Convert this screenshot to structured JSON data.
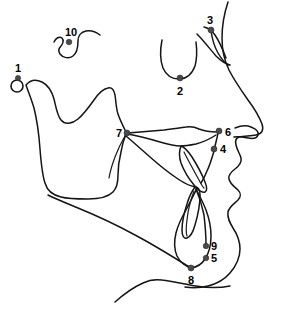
{
  "figure": {
    "type": "lateral-skull-tracing",
    "background_color": "#ffffff",
    "line_color": "#151515",
    "dot_color": "#4a4a4a",
    "label_color": "#000000",
    "width": 282,
    "height": 309
  },
  "landmarks": [
    {
      "id": "1",
      "label": "1",
      "dot_x": 18,
      "dot_y": 78,
      "label_x": 18,
      "label_y": 70,
      "marker": "ring",
      "ring_cx": 17,
      "ring_cy": 86,
      "ring_r": 6
    },
    {
      "id": "2",
      "label": "2",
      "dot_x": 180,
      "dot_y": 78,
      "label_x": 180,
      "label_y": 94,
      "marker": "dot"
    },
    {
      "id": "3",
      "label": "3",
      "dot_x": 211,
      "dot_y": 30,
      "label_x": 210,
      "label_y": 22,
      "marker": "dot"
    },
    {
      "id": "4",
      "label": "4",
      "dot_x": 214,
      "dot_y": 149,
      "label_x": 222,
      "label_y": 153,
      "marker": "dot"
    },
    {
      "id": "5",
      "label": "5",
      "dot_x": 206,
      "dot_y": 258,
      "label_x": 213,
      "label_y": 262,
      "marker": "dot"
    },
    {
      "id": "6",
      "label": "6",
      "dot_x": 219,
      "dot_y": 131,
      "label_x": 226,
      "label_y": 135,
      "marker": "dot"
    },
    {
      "id": "7",
      "label": "7",
      "dot_x": 127,
      "dot_y": 133,
      "label_x": 119,
      "label_y": 137,
      "marker": "dot"
    },
    {
      "id": "8",
      "label": "8",
      "dot_x": 191,
      "dot_y": 268,
      "label_x": 191,
      "label_y": 283,
      "marker": "dot"
    },
    {
      "id": "9",
      "label": "9",
      "dot_x": 206,
      "dot_y": 246,
      "label_x": 213,
      "label_y": 250,
      "marker": "dot"
    },
    {
      "id": "10",
      "label": "10",
      "dot_x": 69,
      "dot_y": 42,
      "label_x": 71,
      "label_y": 36,
      "marker": "dot"
    }
  ],
  "structures": [
    {
      "name": "soft-tissue-profile"
    },
    {
      "name": "nasal-bone"
    },
    {
      "name": "orbit-floor"
    },
    {
      "name": "sella-turcica"
    },
    {
      "name": "mandible-outline"
    },
    {
      "name": "maxilla-palate"
    },
    {
      "name": "upper-incisor"
    },
    {
      "name": "lower-incisor"
    },
    {
      "name": "neck-submental-line"
    },
    {
      "name": "ear-lobe"
    }
  ]
}
